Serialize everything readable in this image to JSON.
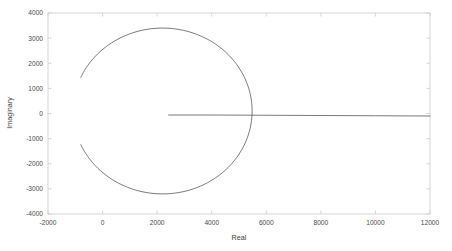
{
  "chart_data": {
    "type": "line",
    "title": "",
    "xlabel": "Real",
    "ylabel": "Imaginary",
    "xlim": [
      -2000,
      12000
    ],
    "ylim": [
      -4000,
      4000
    ],
    "xticks": [
      -2000,
      0,
      2000,
      4000,
      6000,
      8000,
      10000,
      12000
    ],
    "yticks": [
      -4000,
      -3000,
      -2000,
      -1000,
      0,
      1000,
      2000,
      3000,
      4000
    ],
    "xtick_labels": [
      "-2000",
      "0",
      "2000",
      "4000",
      "6000",
      "8000",
      "10000",
      "12000"
    ],
    "ytick_labels": [
      "-4000",
      "-3000",
      "-2000",
      "-1000",
      "0",
      "1000",
      "2000",
      "3000",
      "4000"
    ],
    "grid": false,
    "legend": false,
    "line_color": "#4d4d4d",
    "axis_color": "#cccccc",
    "series": [
      {
        "name": "circular-branch",
        "comment": "near-circular locus, open on the left side",
        "center": [
          2200,
          100
        ],
        "radius_x": 3280,
        "radius_y": 3300,
        "start_angle_deg": 156,
        "end_angle_deg": -156,
        "points": [
          [
            -530,
            1440
          ],
          [
            -430,
            1960
          ],
          [
            -250,
            2440
          ],
          [
            10,
            2850
          ],
          [
            330,
            3150
          ],
          [
            700,
            3330
          ],
          [
            1100,
            3400
          ],
          [
            1500,
            3390
          ],
          [
            1900,
            3330
          ],
          [
            2300,
            3230
          ],
          [
            2700,
            3080
          ],
          [
            3100,
            2880
          ],
          [
            3500,
            2620
          ],
          [
            3900,
            2300
          ],
          [
            4300,
            1900
          ],
          [
            4650,
            1450
          ],
          [
            4950,
            950
          ],
          [
            5200,
            420
          ],
          [
            5350,
            -120
          ],
          [
            5400,
            -660
          ],
          [
            5330,
            -1200
          ],
          [
            5150,
            -1700
          ],
          [
            4880,
            -2150
          ],
          [
            4520,
            -2540
          ],
          [
            4100,
            -2850
          ],
          [
            3640,
            -3070
          ],
          [
            3150,
            -3210
          ],
          [
            2650,
            -3260
          ],
          [
            2150,
            -3230
          ],
          [
            1680,
            -3130
          ],
          [
            1230,
            -2960
          ],
          [
            820,
            -2720
          ],
          [
            450,
            -2420
          ],
          [
            140,
            -2060
          ],
          [
            -110,
            -1650
          ],
          [
            -300,
            -1200
          ],
          [
            -420,
            -780
          ],
          [
            -480,
            -1440
          ]
        ]
      },
      {
        "name": "real-axis-branch",
        "comment": "nearly horizontal branch just below the real axis",
        "points": [
          [
            2420,
            -60
          ],
          [
            4000,
            -60
          ],
          [
            6000,
            -70
          ],
          [
            8000,
            -80
          ],
          [
            10000,
            -90
          ],
          [
            12000,
            -100
          ]
        ]
      }
    ]
  },
  "axis": {
    "x_title": "Real",
    "y_title": "Imaginary"
  }
}
